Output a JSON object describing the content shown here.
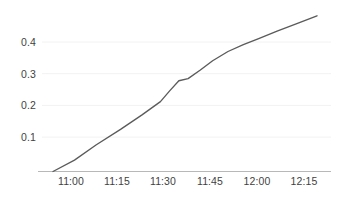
{
  "chart_data": {
    "type": "line",
    "title": "",
    "subtitle": "",
    "xlabel": "",
    "ylabel": "",
    "legend": [],
    "legend_position": "none",
    "grid": true,
    "grid_axis": "y",
    "x_type": "time",
    "xlim": [
      "10:52",
      "12:20"
    ],
    "ylim": [
      0.0,
      0.52
    ],
    "x_ticks": [
      "11:00",
      "11:15",
      "11:30",
      "11:45",
      "12:00",
      "12:15"
    ],
    "y_ticks": [
      "0.1",
      "0.2",
      "0.3",
      "0.4"
    ],
    "y_tick_values": [
      0.1,
      0.2,
      0.3,
      0.4
    ],
    "series": [
      {
        "name": "value",
        "color": "#5b5b5b",
        "x": [
          "10:53",
          "11:00",
          "11:07",
          "11:15",
          "11:22",
          "11:28",
          "11:31",
          "11:34",
          "11:37",
          "11:41",
          "11:45",
          "11:50",
          "11:55",
          "12:00",
          "12:06",
          "12:12",
          "12:19"
        ],
        "values": [
          0.0,
          0.037,
          0.086,
          0.137,
          0.184,
          0.227,
          0.262,
          0.295,
          0.302,
          0.33,
          0.36,
          0.39,
          0.412,
          0.432,
          0.456,
          0.479,
          0.506
        ]
      }
    ],
    "annotations": []
  },
  "axes": {
    "y_axis_name": "y-axis",
    "x_axis_name": "x-axis",
    "baseline_color": "#b8b8b8",
    "gridline_color": "#f2f2f2",
    "tick_label_color": "#3f3f3f"
  },
  "colors": {
    "background": "#ffffff",
    "line": "#5b5b5b",
    "grid": "#f2f2f2",
    "axis": "#b8b8b8"
  }
}
